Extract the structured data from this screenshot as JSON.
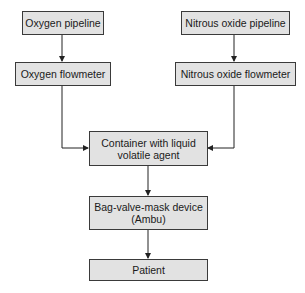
{
  "diagram": {
    "type": "flowchart",
    "nodes": [
      {
        "id": "oxygen_pipeline",
        "label": "Oxygen pipeline"
      },
      {
        "id": "nitrous_pipeline",
        "label": "Nitrous oxide pipeline"
      },
      {
        "id": "oxygen_flowmeter",
        "label": "Oxygen flowmeter"
      },
      {
        "id": "nitrous_flowmeter",
        "label": "Nitrous oxide flowmeter"
      },
      {
        "id": "container",
        "label_line1": "Container with liquid",
        "label_line2": "volatile agent"
      },
      {
        "id": "bag_valve_mask",
        "label_line1": "Bag-valve-mask device",
        "label_line2": "(Ambu)"
      },
      {
        "id": "patient",
        "label": "Patient"
      }
    ],
    "edges": [
      {
        "from": "oxygen_pipeline",
        "to": "oxygen_flowmeter"
      },
      {
        "from": "nitrous_pipeline",
        "to": "nitrous_flowmeter"
      },
      {
        "from": "oxygen_flowmeter",
        "to": "container"
      },
      {
        "from": "nitrous_flowmeter",
        "to": "container"
      },
      {
        "from": "container",
        "to": "bag_valve_mask"
      },
      {
        "from": "bag_valve_mask",
        "to": "patient"
      }
    ],
    "colors": {
      "box_fill": "#e2e2e2",
      "box_border": "#3a3a3a",
      "line": "#222222"
    }
  }
}
